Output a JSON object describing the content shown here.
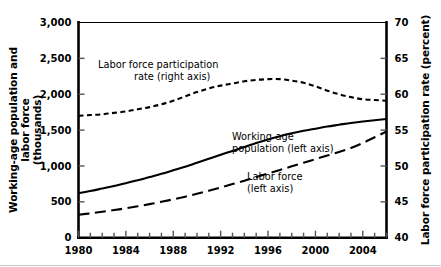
{
  "chart_data": {
    "type": "line",
    "title": "",
    "xlabel": "",
    "ylabel": "Working-age population and labor force (thousands)",
    "ylabel_right": "Labor force participation rate (percent)",
    "xlim": [
      1980,
      2006
    ],
    "ylim": [
      0,
      3000
    ],
    "ylim_right": [
      40,
      70
    ],
    "grid": false,
    "legend_position": "inline-annotations",
    "x_tick_labels": [
      "1980",
      "1984",
      "1988",
      "1992",
      "1996",
      "2000",
      "2004"
    ],
    "x_tick_values": [
      1980,
      1984,
      1988,
      1992,
      1996,
      2000,
      2004
    ],
    "x_minor_ticks": [
      1980,
      1981,
      1982,
      1983,
      1984,
      1985,
      1986,
      1987,
      1988,
      1989,
      1990,
      1991,
      1992,
      1993,
      1994,
      1995,
      1996,
      1997,
      1998,
      1999,
      2000,
      2001,
      2002,
      2003,
      2004,
      2005,
      2006
    ],
    "y_tick_labels": [
      "0",
      "500",
      "1,000",
      "1,500",
      "2,000",
      "2,500",
      "3,000"
    ],
    "y_tick_values": [
      0,
      500,
      1000,
      1500,
      2000,
      2500,
      3000
    ],
    "y_right_tick_labels": [
      "40",
      "45",
      "50",
      "55",
      "60",
      "65",
      "70"
    ],
    "y_right_tick_values": [
      40,
      45,
      50,
      55,
      60,
      65,
      70
    ],
    "x": [
      1980,
      1981,
      1982,
      1983,
      1984,
      1985,
      1986,
      1987,
      1988,
      1989,
      1990,
      1991,
      1992,
      1993,
      1994,
      1995,
      1996,
      1997,
      1998,
      1999,
      2000,
      2001,
      2002,
      2003,
      2004,
      2005,
      2006
    ],
    "series": [
      {
        "name": "Labor force participation rate (right axis)",
        "axis": "right",
        "style": "short-dashed",
        "color": "#000000",
        "values": [
          57.0,
          57.1,
          57.2,
          57.4,
          57.6,
          57.9,
          58.2,
          58.6,
          59.1,
          59.7,
          60.3,
          60.8,
          61.2,
          61.5,
          61.8,
          62.0,
          62.1,
          62.1,
          61.9,
          61.6,
          61.1,
          60.5,
          60.0,
          59.6,
          59.3,
          59.2,
          59.1
        ]
      },
      {
        "name": "Working-age population (left axis)",
        "axis": "left",
        "style": "solid",
        "color": "#000000",
        "values": [
          620,
          650,
          685,
          720,
          760,
          800,
          845,
          890,
          940,
          990,
          1045,
          1100,
          1155,
          1210,
          1265,
          1320,
          1370,
          1415,
          1455,
          1490,
          1520,
          1550,
          1575,
          1600,
          1620,
          1638,
          1655
        ]
      },
      {
        "name": "Labor force (left axis)",
        "axis": "left",
        "style": "long-dashed",
        "color": "#000000",
        "values": [
          320,
          340,
          362,
          385,
          410,
          438,
          468,
          500,
          535,
          572,
          612,
          655,
          700,
          748,
          795,
          845,
          895,
          945,
          995,
          1045,
          1095,
          1145,
          1195,
          1250,
          1320,
          1400,
          1480
        ]
      }
    ],
    "annotations": [
      {
        "text_line1": "Labor force participation",
        "text_line2": "rate (right axis)",
        "x": 98,
        "y": 68
      },
      {
        "text_line1": "Working-age",
        "text_line2": "population (left axis)",
        "x": 232,
        "y": 140
      },
      {
        "text_line1": "Labor force",
        "text_line2": "(left axis)",
        "x": 247,
        "y": 180
      }
    ]
  }
}
